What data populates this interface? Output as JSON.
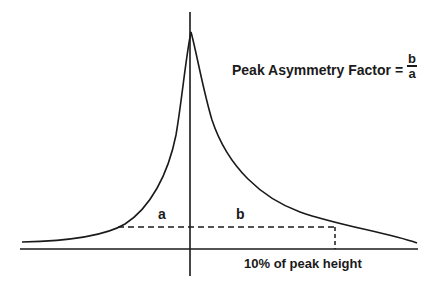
{
  "diagram": {
    "title": "Peak Asymmetry Factor =",
    "fraction": {
      "numerator": "b",
      "denominator": "a"
    },
    "labels": {
      "a": "a",
      "b": "b",
      "height_note": "10% of peak height"
    },
    "colors": {
      "line": "#1a1a1a",
      "background": "#ffffff"
    },
    "elements": {
      "peak_curve": "asymmetric tailing chromatographic peak",
      "vertical_axis": "peak centre line",
      "baseline": "horizontal baseline",
      "measurement_line": "dashed horizontal line at 10% of peak height",
      "right_drop_line": "dashed vertical drop to baseline"
    }
  }
}
